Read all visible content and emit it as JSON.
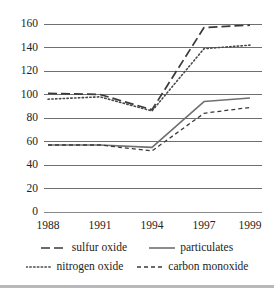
{
  "chart_data": {
    "type": "line",
    "title": "",
    "xlabel": "",
    "ylabel": "",
    "categories": [
      "1988",
      "1991",
      "1994",
      "1997",
      "1999"
    ],
    "x": [
      1988,
      1991,
      1994,
      1997,
      1999
    ],
    "ylim": [
      0,
      160
    ],
    "ytick_values": [
      0,
      20,
      40,
      60,
      80,
      100,
      120,
      140,
      160
    ],
    "ytick_labels": [
      "0",
      "20",
      "40",
      "60",
      "80",
      "100",
      "120",
      "140",
      "160"
    ],
    "grid": "horizontal",
    "legend_position": "bottom",
    "series": [
      {
        "name": "sulfur oxide",
        "values": [
          101,
          100,
          87,
          157,
          159
        ],
        "style": "long-dash",
        "color": "#3a3a3a"
      },
      {
        "name": "particulates",
        "values": [
          57,
          57,
          55,
          94,
          97
        ],
        "style": "solid",
        "color": "#707070"
      },
      {
        "name": "nitrogen oxide",
        "values": [
          96,
          98,
          86,
          139,
          142
        ],
        "style": "dotted",
        "color": "#4a4a4a"
      },
      {
        "name": "carbon monoxide",
        "values": [
          57,
          57,
          52,
          84,
          89
        ],
        "style": "short-dash",
        "color": "#3a3a3a"
      }
    ]
  },
  "legend": {
    "entries": [
      {
        "label": "sulfur oxide",
        "style": "long-dash"
      },
      {
        "label": "particulates",
        "style": "solid"
      },
      {
        "label": "nitrogen oxide",
        "style": "dotted"
      },
      {
        "label": "carbon monoxide",
        "style": "short-dash"
      }
    ]
  },
  "colors": {
    "gridline": "#6f6f73",
    "axis": "#8a8a8e",
    "text": "#232323",
    "background": "#ffffff",
    "bottom_rule": "#b9b9bd"
  }
}
